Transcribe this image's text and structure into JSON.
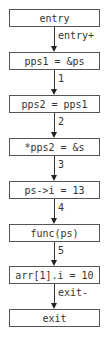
{
  "diagram": {
    "type": "control-flow-graph",
    "nodes": [
      {
        "id": "n0",
        "label": "entry"
      },
      {
        "id": "n1",
        "label": "pps1 = &ps"
      },
      {
        "id": "n2",
        "label": "pps2 = pps1"
      },
      {
        "id": "n3",
        "label": "*pps2 = &s"
      },
      {
        "id": "n4",
        "label": "ps->i = 13"
      },
      {
        "id": "n5",
        "label": "func(ps)"
      },
      {
        "id": "n6",
        "label": "arr[1].i = 10"
      },
      {
        "id": "n7",
        "label": "exit"
      }
    ],
    "edges": [
      {
        "from": "n0",
        "to": "n1",
        "label": "entry+"
      },
      {
        "from": "n1",
        "to": "n2",
        "label": "1"
      },
      {
        "from": "n2",
        "to": "n3",
        "label": "2"
      },
      {
        "from": "n3",
        "to": "n4",
        "label": "3"
      },
      {
        "from": "n4",
        "to": "n5",
        "label": "4"
      },
      {
        "from": "n5",
        "to": "n6",
        "label": "5"
      },
      {
        "from": "n6",
        "to": "n7",
        "label": "exit-"
      }
    ],
    "colors": {
      "node_border": "#555555",
      "text": "#333333",
      "edge": "#333333",
      "background": "#ffffff"
    }
  }
}
